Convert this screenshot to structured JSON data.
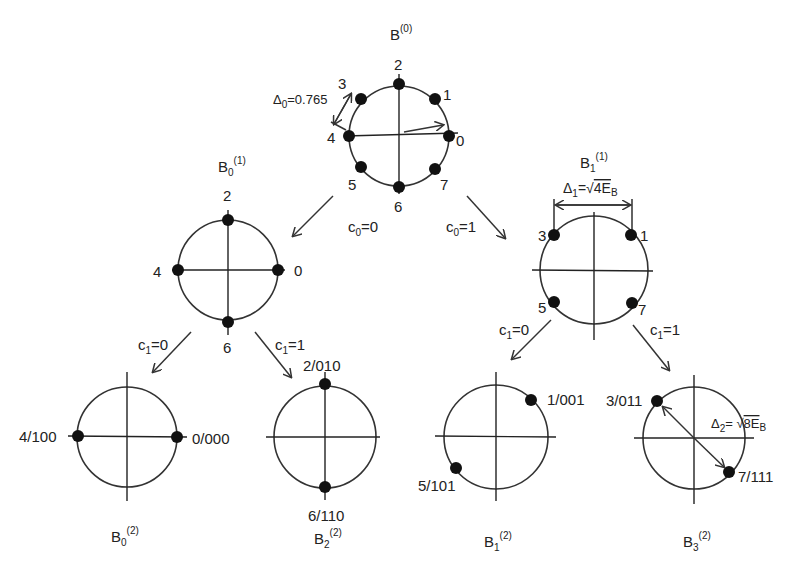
{
  "diagram": {
    "type": "set-partitioning tree (8-PSK)",
    "root": {
      "title_base": "B",
      "title_sup": "(0)",
      "delta_label": "Δ",
      "delta_sub": "0",
      "delta_value": "=0.765",
      "points": [
        "0",
        "1",
        "2",
        "3",
        "4",
        "5",
        "6",
        "7"
      ]
    },
    "level1": [
      {
        "title_base": "B",
        "title_sub": "0",
        "title_sup": "(1)",
        "points": [
          "0",
          "2",
          "4",
          "6"
        ],
        "edge_label": "c",
        "edge_sub": "0",
        "edge_value": "=0"
      },
      {
        "title_base": "B",
        "title_sub": "1",
        "title_sup": "(1)",
        "points": [
          "1",
          "3",
          "5",
          "7"
        ],
        "edge_label": "c",
        "edge_sub": "0",
        "edge_value": "=1",
        "delta_label": "Δ",
        "delta_sub": "1",
        "delta_eq": "=",
        "delta_value": "4E",
        "delta_value_sub": "B"
      }
    ],
    "level2": [
      {
        "title_base": "B",
        "title_sub": "0",
        "title_sup": "(2)",
        "points": [
          "4/100",
          "0/000"
        ],
        "edge_label": "c",
        "edge_sub": "1",
        "edge_value": "=0"
      },
      {
        "title_base": "B",
        "title_sub": "2",
        "title_sup": "(2)",
        "points": [
          "2/010",
          "6/110"
        ],
        "edge_label": "c",
        "edge_sub": "1",
        "edge_value": "=1"
      },
      {
        "title_base": "B",
        "title_sub": "1",
        "title_sup": "(2)",
        "points": [
          "1/001",
          "5/101"
        ],
        "edge_label": "c",
        "edge_sub": "1",
        "edge_value": "=0"
      },
      {
        "title_base": "B",
        "title_sub": "3",
        "title_sup": "(2)",
        "points": [
          "3/011",
          "7/111"
        ],
        "edge_label": "c",
        "edge_sub": "1",
        "edge_value": "=1",
        "delta_label": "Δ",
        "delta_sub": "2",
        "delta_eq": "=",
        "delta_value": "8E",
        "delta_value_sub": "B"
      }
    ]
  }
}
